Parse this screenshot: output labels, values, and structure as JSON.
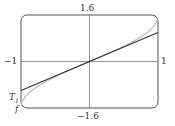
{
  "chart_data": {
    "type": "line",
    "title": "",
    "xlabel": "",
    "ylabel": "",
    "xlim": [
      -1,
      1
    ],
    "ylim": [
      -1.6,
      1.6
    ],
    "grid": false,
    "tick_labels": {
      "x_left": "-1",
      "x_right": "1",
      "y_top": "1.6",
      "y_bottom": "-1.6"
    },
    "series": [
      {
        "name": "f",
        "description": "arcsin-like curve, steeper near ends",
        "x": [
          -1,
          -0.9,
          -0.5,
          0,
          0.5,
          0.9,
          1
        ],
        "y": [
          -1.5708,
          -1.1198,
          -0.5236,
          0,
          0.5236,
          1.1198,
          1.5708
        ]
      },
      {
        "name": "T1",
        "description": "linear Taylor polynomial T1(x)=x",
        "x": [
          -1,
          1
        ],
        "y": [
          -1,
          1
        ]
      }
    ],
    "annotations": [
      "T1",
      "f"
    ]
  },
  "labels": {
    "y_top": "1.6",
    "y_bottom": "−1.6",
    "x_left": "−1",
    "x_right": "1",
    "t1": "T",
    "t1_sub": "1",
    "f": "f"
  }
}
